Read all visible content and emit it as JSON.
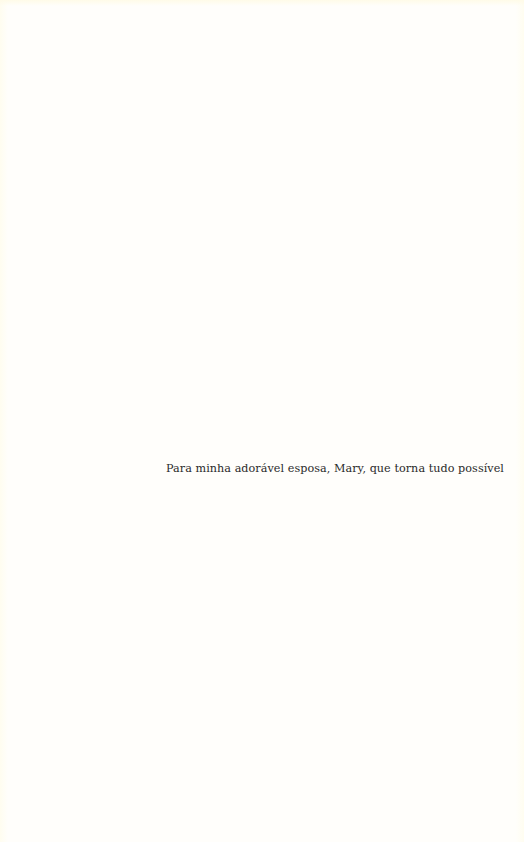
{
  "page": {
    "background_color": "#fffefb",
    "dedication": "Para minha adorável esposa, Mary, que torna tudo possível"
  }
}
